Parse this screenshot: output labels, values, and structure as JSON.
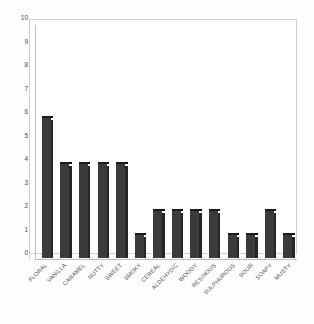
{
  "chart_data": {
    "type": "bar",
    "title": "",
    "subtitle": "",
    "xlabel": "",
    "ylabel": "",
    "ylim": [
      0,
      10
    ],
    "yticks": [
      0,
      1,
      2,
      3,
      4,
      5,
      6,
      7,
      8,
      9,
      10
    ],
    "grid": false,
    "legend": null,
    "bar_color": "#3b3b3b",
    "bar_side_color": "#262626",
    "axis_color": "#bdbdbd",
    "background_color": "#ffffff",
    "style": "3d-bar",
    "categories": [
      "FLORAL",
      "VANILLA",
      "CARAMEL",
      "NUTTY",
      "SWEET",
      "SMOKY",
      "CEREAL",
      "ALDEHYDIC",
      "WOODY",
      "RESINOUS",
      "SULPHUROUS",
      "SOUR",
      "SOAPY",
      "MUSTY"
    ],
    "values": [
      6,
      4,
      4,
      4,
      4,
      1,
      2,
      2,
      2,
      2,
      1,
      1,
      2,
      1
    ]
  }
}
